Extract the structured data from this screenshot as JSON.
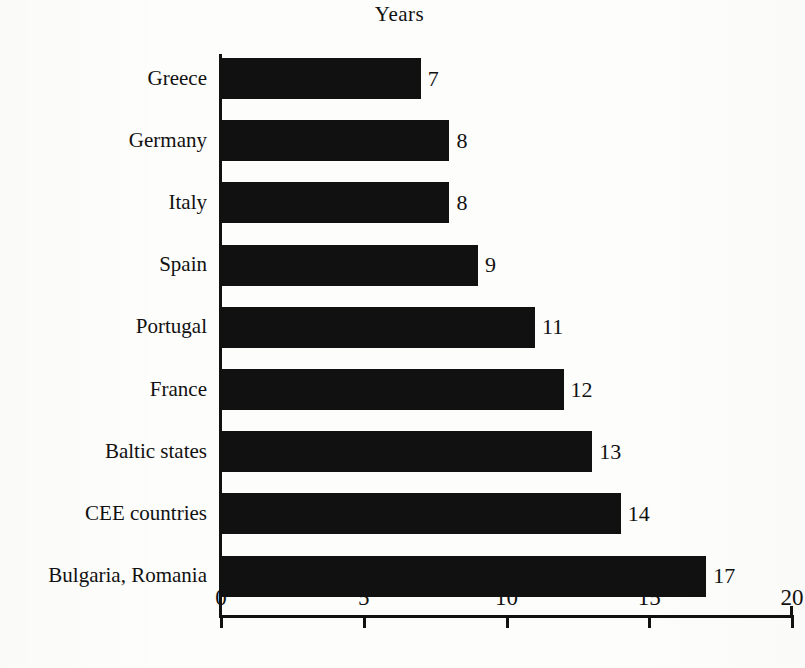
{
  "chart_data": {
    "type": "bar",
    "orientation": "horizontal",
    "title": "Years",
    "xlabel": "",
    "ylabel": "",
    "xlim": [
      0,
      20
    ],
    "xticks": [
      0,
      5,
      10,
      15,
      20
    ],
    "xtick_labels": [
      "0",
      "5",
      "10",
      "15",
      "20"
    ],
    "grid": false,
    "legend": false,
    "bar_color": "#111111",
    "background_color": "#fdfdfb",
    "data_labels": true,
    "categories": [
      "Greece",
      "Germany",
      "Italy",
      "Spain",
      "Portugal",
      "France",
      "Baltic states",
      "CEE countries",
      "Bulgaria, Romania"
    ],
    "values": [
      7,
      8,
      8,
      9,
      11,
      12,
      13,
      14,
      17
    ],
    "value_labels": [
      "7",
      "8",
      "8",
      "9",
      "11",
      "12",
      "13",
      "14",
      "17"
    ]
  }
}
